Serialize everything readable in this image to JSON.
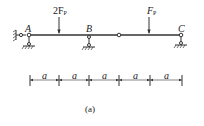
{
  "diagram": {
    "type": "beam",
    "points": [
      {
        "label": "A",
        "x": 29
      },
      {
        "label": "B",
        "x": 89
      },
      {
        "label": "C",
        "x": 181
      }
    ],
    "hinge_x": 119,
    "loads": [
      {
        "label_main": "2F",
        "label_sub": "P",
        "x": 59
      },
      {
        "label_main": "F",
        "label_sub": "P",
        "x": 149
      }
    ],
    "dimensions": [
      "a",
      "a",
      "a",
      "a",
      "a"
    ],
    "caption": "(a)",
    "line_color": "#333333"
  }
}
